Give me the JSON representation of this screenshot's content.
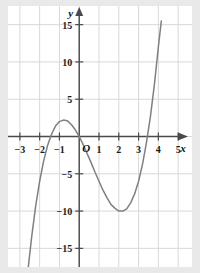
{
  "figure": {
    "background_color": "#e9e9e9",
    "plot_background_color": "#ffffff",
    "grid_color": "#d8d8d8",
    "axis_color": "#4a4a4a",
    "curve_color": "#808080"
  },
  "labels": {
    "x_axis": "x",
    "y_axis": "y",
    "origin": "O"
  },
  "chart_data": {
    "type": "line",
    "title": "",
    "xlabel": "x",
    "ylabel": "y",
    "xlim": [
      -3.6,
      5.7
    ],
    "ylim": [
      -17.5,
      17.5
    ],
    "grid": true,
    "legend": "none",
    "x_ticks": [
      -3,
      -2,
      -1,
      1,
      2,
      3,
      4,
      5
    ],
    "x_tick_labels": [
      "−3",
      "−2",
      "−1",
      "1",
      "2",
      "3",
      "4",
      "5"
    ],
    "y_ticks": [
      -15,
      -10,
      -5,
      5,
      10,
      15
    ],
    "y_tick_labels": [
      "−15",
      "−10",
      "−5",
      "5",
      "10",
      "15"
    ],
    "x_grid_lines": [
      -3,
      -2,
      -1,
      0,
      1,
      2,
      3,
      4,
      5
    ],
    "y_grid_lines": [
      -15,
      -10,
      -5,
      0,
      5,
      10,
      15
    ],
    "series": [
      {
        "name": "cubic",
        "equation": "y = x^3 - 2x^2 - 5x",
        "roots": [
          -2,
          0,
          3.6
        ],
        "local_maximum": [
          -1,
          3
        ],
        "local_minimum": [
          2,
          -12
        ],
        "x": [
          -2.75,
          -2.6,
          -2.4,
          -2.2,
          -2.0,
          -1.8,
          -1.6,
          -1.4,
          -1.2,
          -1.0,
          -0.8,
          -0.6,
          -0.4,
          -0.2,
          0.0,
          0.2,
          0.4,
          0.6,
          0.8,
          1.0,
          1.2,
          1.4,
          1.6,
          1.8,
          2.0,
          2.2,
          2.4,
          2.6,
          2.8,
          3.0,
          3.2,
          3.4,
          3.6,
          3.8,
          4.0,
          4.15
        ],
        "y": [
          -22.2,
          -18.1,
          -13.4,
          -9.3,
          -6.0,
          -3.3,
          -1.2,
          0.3,
          1.4,
          2.0,
          2.2,
          2.1,
          1.6,
          0.9,
          0.0,
          -1.1,
          -2.3,
          -3.5,
          -4.8,
          -6.0,
          -7.2,
          -8.2,
          -9.1,
          -9.6,
          -10.0,
          -10.0,
          -9.7,
          -8.9,
          -7.7,
          -6.0,
          -3.7,
          -0.8,
          2.7,
          7.0,
          12.0,
          15.5
        ]
      }
    ]
  }
}
